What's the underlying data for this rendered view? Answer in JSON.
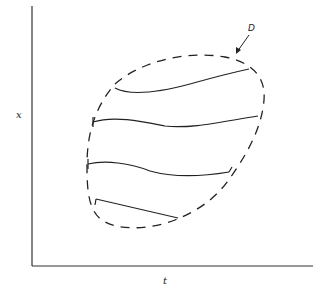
{
  "diagram": {
    "axes": {
      "y_label": "x",
      "x_label": "t"
    },
    "region_label": "D",
    "region_description": "dashed closed boundary of region D in the t-x plane",
    "curves_count": 4,
    "colors": {
      "stroke": "#222222",
      "background": "#ffffff"
    }
  }
}
